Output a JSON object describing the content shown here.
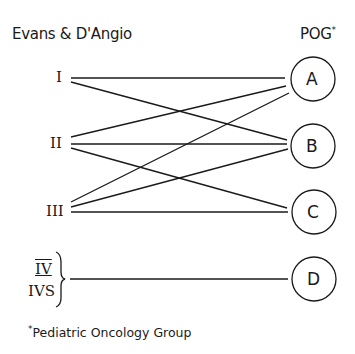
{
  "header": {
    "left_title": "Evans & D'Angio",
    "right_title": "POG",
    "right_title_mark": "*"
  },
  "left_stages": [
    {
      "id": "I",
      "label": "I",
      "y": 78
    },
    {
      "id": "II",
      "label": "II",
      "y": 144
    },
    {
      "id": "III",
      "label": "III",
      "y": 212
    },
    {
      "id": "IV",
      "label": "IV",
      "y": 270
    },
    {
      "id": "IVS",
      "label": "IVS",
      "y": 290
    }
  ],
  "right_groups": [
    {
      "id": "A",
      "label": "A",
      "cx": 313,
      "cy": 79
    },
    {
      "id": "B",
      "label": "B",
      "cx": 313,
      "cy": 146
    },
    {
      "id": "C",
      "label": "C",
      "cx": 314,
      "cy": 212
    },
    {
      "id": "D",
      "label": "D",
      "cx": 314,
      "cy": 279
    }
  ],
  "connections": [
    {
      "from": "I",
      "to": "A"
    },
    {
      "from": "I",
      "to": "B"
    },
    {
      "from": "II",
      "to": "A"
    },
    {
      "from": "II",
      "to": "B"
    },
    {
      "from": "II",
      "to": "C"
    },
    {
      "from": "III",
      "to": "A"
    },
    {
      "from": "III",
      "to": "B"
    },
    {
      "from": "III",
      "to": "C"
    },
    {
      "from": "IV/IVS",
      "to": "D"
    }
  ],
  "footnote": {
    "mark": "*",
    "text": "Pediatric Oncology Group"
  }
}
